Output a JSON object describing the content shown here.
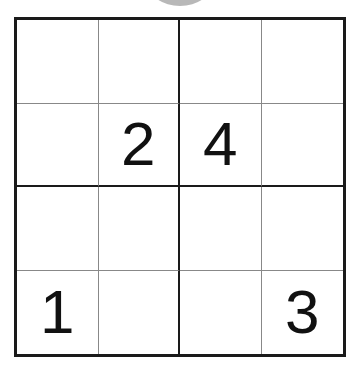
{
  "puzzle": {
    "size": 4,
    "cells": [
      [
        "",
        "",
        "",
        ""
      ],
      [
        "",
        "2",
        "4",
        ""
      ],
      [
        "",
        "",
        "",
        ""
      ],
      [
        "1",
        "",
        "",
        "3"
      ]
    ]
  }
}
